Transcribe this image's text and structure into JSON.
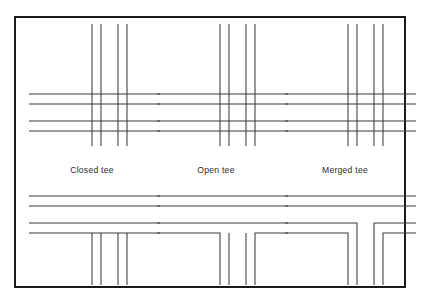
{
  "figure": {
    "background_color": "#ffffff",
    "frame": {
      "name": "figure-border",
      "x": 14,
      "y": 16,
      "width": 392,
      "height": 272,
      "stroke_color": "#1a1a1a",
      "stroke_width": 2
    },
    "line_color": "#3a3a3a",
    "line_width": 1.05,
    "captions": [
      {
        "id": "closed",
        "label": "Closed tee",
        "x": 92,
        "y": 173
      },
      {
        "id": "open",
        "label": "Open tee",
        "x": 216,
        "y": 173
      },
      {
        "id": "merged",
        "label": "Merged tee",
        "x": 345,
        "y": 173
      }
    ],
    "panels": [
      {
        "id": "closed-crossing",
        "name": "closed-tee-crossing",
        "row": "top",
        "column": 1,
        "caption_ref": "Closed tee",
        "description": "Full four-way crossing: all four horizontal casing lines and all four vertical casing lines pass straight through the intersection with no breaks.",
        "origin_x": 30,
        "origin_y": 24,
        "horizontal_y": [
          70,
          80,
          97,
          107
        ],
        "vertical_x": [
          62,
          71,
          88,
          97
        ],
        "h_extent": [
          -1,
          130
        ],
        "v_extent": [
          0,
          122
        ]
      },
      {
        "id": "open-crossing",
        "name": "open-tee-crossing",
        "row": "top",
        "column": 2,
        "caption_ref": "Open tee",
        "description": "Full four-way crossing: all four horizontal casing lines and all four vertical casing lines pass straight through the intersection with no breaks.",
        "origin_x": 158,
        "origin_y": 24,
        "horizontal_y": [
          70,
          80,
          97,
          107
        ],
        "vertical_x": [
          62,
          71,
          88,
          97
        ],
        "h_extent": [
          -1,
          130
        ],
        "v_extent": [
          0,
          122
        ]
      },
      {
        "id": "merged-crossing",
        "name": "merged-tee-crossing",
        "row": "top",
        "column": 3,
        "caption_ref": "Merged tee",
        "description": "Full four-way crossing: all four horizontal casing lines and all four vertical casing lines pass straight through the intersection with no breaks.",
        "origin_x": 286,
        "origin_y": 24,
        "horizontal_y": [
          70,
          80,
          97,
          107
        ],
        "vertical_x": [
          62,
          71,
          88,
          97
        ],
        "h_extent": [
          -1,
          130
        ],
        "v_extent": [
          0,
          122
        ]
      },
      {
        "id": "closed-tee",
        "name": "closed-tee-junction",
        "row": "bottom",
        "column": 1,
        "caption_ref": "Closed tee",
        "description": "Closed tee: every horizontal casing line runs unbroken straight across the junction; the four vertical casing lines simply stop where they meet the lowest horizontal line.",
        "origin_x": 30,
        "origin_y": 190,
        "horizontal_y": [
          6,
          16,
          33,
          43
        ],
        "vertical_x": [
          62,
          71,
          88,
          97
        ],
        "h_extent": [
          -1,
          130
        ],
        "v_extent": [
          43,
          95
        ]
      },
      {
        "id": "open-tee",
        "name": "open-tee-junction",
        "row": "bottom",
        "column": 2,
        "caption_ref": "Open tee",
        "description": "Open tee: the lowest horizontal casing line is broken at the mouth of the side road and turns down to join the two outer vertical casing lines; the two inner verticals remain free-standing and the junction mouth stays open.",
        "origin_x": 158,
        "origin_y": 190,
        "horizontal_y": [
          6,
          16,
          33,
          43
        ],
        "vertical_x": [
          62,
          71,
          88,
          97
        ],
        "h_extent": [
          -1,
          130
        ],
        "v_extent": [
          43,
          95
        ]
      },
      {
        "id": "merged-tee",
        "name": "merged-tee-junction",
        "row": "bottom",
        "column": 3,
        "caption_ref": "Merged tee",
        "description": "Merged tee: the two lowest horizontal casing lines both bend down through square corners and continue as the vertical casing lines of the side road, so the two carriageway outlines merge into one continuous outline.",
        "origin_x": 286,
        "origin_y": 190,
        "horizontal_y": [
          6,
          16,
          33,
          43
        ],
        "vertical_x": [
          62,
          71,
          88,
          97
        ],
        "h_extent": [
          -1,
          130
        ],
        "v_extent": [
          43,
          95
        ]
      }
    ]
  }
}
